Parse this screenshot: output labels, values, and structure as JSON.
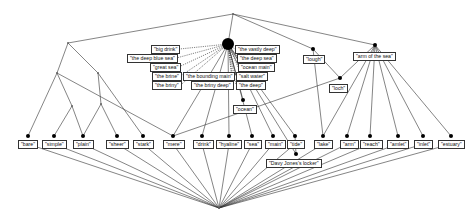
{
  "diagram": {
    "colors": {
      "line": "#333333",
      "node": "#000000",
      "background": "#ffffff"
    },
    "hub": {
      "x": 228,
      "y": 44,
      "r": 6
    },
    "top": {
      "x": 233,
      "y": 14
    },
    "bottom": {
      "x": 219,
      "y": 208
    },
    "hub_labels": [
      {
        "text": "\"big drink\"",
        "x": 151,
        "y": 45
      },
      {
        "text": "\"the deep blue sea\"",
        "x": 127,
        "y": 54
      },
      {
        "text": "\"great sea\"",
        "x": 150,
        "y": 63
      },
      {
        "text": "\"the brine\"",
        "x": 152,
        "y": 72
      },
      {
        "text": "\"the briny\"",
        "x": 152,
        "y": 81
      },
      {
        "text": "\"the bounding main\"",
        "x": 183,
        "y": 72
      },
      {
        "text": "\"the briny deep\"",
        "x": 191,
        "y": 81
      },
      {
        "text": "\"the vastly deep\"",
        "x": 235,
        "y": 45
      },
      {
        "text": "\"the deep sea\"",
        "x": 237,
        "y": 54
      },
      {
        "text": "\"ocean main\"",
        "x": 238,
        "y": 63
      },
      {
        "text": "\"salt water\"",
        "x": 236,
        "y": 72
      },
      {
        "text": "\"the deep\"",
        "x": 236,
        "y": 81
      }
    ],
    "upper_nodes": [
      {
        "id": "lough",
        "text": "\"lough\"",
        "x": 313,
        "y": 49,
        "lx": 303,
        "ly": 55
      },
      {
        "id": "arm",
        "text": "\"arm of the sea\"",
        "x": 375,
        "y": 45,
        "lx": 353,
        "ly": 52
      },
      {
        "id": "loch",
        "text": "\"loch\"",
        "x": 340,
        "y": 78,
        "lx": 329,
        "ly": 84
      },
      {
        "id": "ocean",
        "text": "\"ocean\"",
        "x": 243,
        "y": 100,
        "lx": 233,
        "ly": 105
      }
    ],
    "bottom_nodes": [
      {
        "text": "\"bare\"",
        "x": 28,
        "lx": 18
      },
      {
        "text": "\"simple\"",
        "x": 54,
        "lx": 42
      },
      {
        "text": "\"plain\"",
        "x": 83,
        "lx": 73
      },
      {
        "text": "\"sheer\"",
        "x": 117,
        "lx": 106
      },
      {
        "text": "\"stark\"",
        "x": 143,
        "lx": 133
      },
      {
        "text": "\"mere\"",
        "x": 173,
        "lx": 163
      },
      {
        "text": "\"drink\"",
        "x": 202,
        "lx": 193
      },
      {
        "text": "\"hyaline\"",
        "x": 229,
        "lx": 216
      },
      {
        "text": "\"sea\"",
        "x": 252,
        "lx": 244
      },
      {
        "text": "\"main\"",
        "x": 273,
        "lx": 265
      },
      {
        "text": "\"tide\"",
        "x": 295,
        "lx": 287
      },
      {
        "text": "\"lake\"",
        "x": 323,
        "lx": 314
      },
      {
        "text": "\"arm\"",
        "x": 347,
        "lx": 340
      },
      {
        "text": "\"reach\"",
        "x": 370,
        "lx": 360
      },
      {
        "text": "\"amlet\"",
        "x": 398,
        "lx": 387
      },
      {
        "text": "\"inlet\"",
        "x": 423,
        "lx": 414
      },
      {
        "text": "\"estuary\"",
        "x": 451,
        "lx": 438
      }
    ],
    "bottom_row_y": 136,
    "davy": {
      "text": "\"Davy Jones's locker\"",
      "x": 296,
      "y": 154,
      "lx": 266,
      "ly": 159
    },
    "left_small_nodes": [
      {
        "x": 68,
        "y": 43
      },
      {
        "x": 57,
        "y": 73
      },
      {
        "x": 98,
        "y": 73
      },
      {
        "x": 72,
        "y": 106
      },
      {
        "x": 101,
        "y": 104
      }
    ]
  }
}
